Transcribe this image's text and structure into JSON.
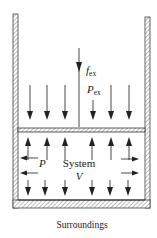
{
  "diagram": {
    "labels": {
      "external_force_symbol": "f",
      "external_force_sub": "ex",
      "external_pressure_symbol": "P",
      "external_pressure_sub": "ex",
      "internal_pressure": "P",
      "system": "System",
      "volume": "V",
      "surroundings": "Surroundings"
    },
    "colors": {
      "line": "#222222",
      "hatch": "#888888",
      "background": "#ffffff"
    }
  }
}
